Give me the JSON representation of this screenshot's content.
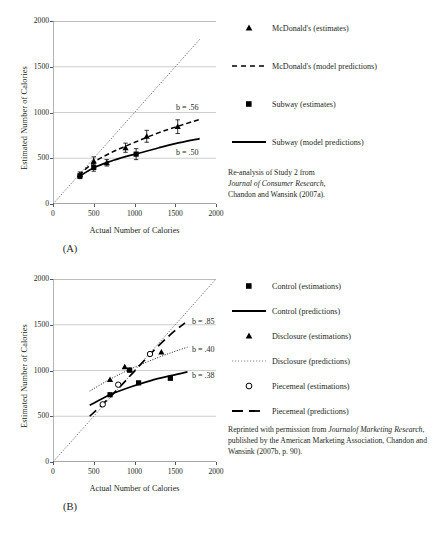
{
  "figure": {
    "panels": [
      {
        "id": "A",
        "panel_label": "(A)",
        "credit_lines": [
          {
            "text": "Re-analysis of Study 2 from",
            "italic": false
          },
          {
            "text": "Journal of Consumer Research,",
            "italic": true
          },
          {
            "text": "Chandon and Wansink (2007a).",
            "italic": false
          }
        ],
        "legend": [
          {
            "label": "McDonald's (estimates)",
            "key": "triangle-marker"
          },
          {
            "label": "McDonald's (model predictions)",
            "key": "dashed-line"
          },
          {
            "label": "Subway (estimates)",
            "key": "square-marker"
          },
          {
            "label": "Subway (model predictions)",
            "key": "solid-line"
          }
        ],
        "slope_labels": [
          {
            "text": "b = .56",
            "series": "McDonald's"
          },
          {
            "text": "b = .50",
            "series": "Subway"
          }
        ]
      },
      {
        "id": "B",
        "panel_label": "(B)",
        "credit_lines": [
          {
            "text": "Reprinted with permission from ",
            "italic": false
          },
          {
            "text": "Journal",
            "italic": true
          },
          {
            "text": "of Marketing Research",
            "italic": true
          },
          {
            "text": ", published by the",
            "italic": false
          },
          {
            "text": "American Marketing Association,",
            "italic": false
          },
          {
            "text": "Chandon and Wansink (2007b, p. 90).",
            "italic": false
          }
        ],
        "legend": [
          {
            "label": "Control (estimations)",
            "key": "square-marker"
          },
          {
            "label": "Control (predictions)",
            "key": "solid-line"
          },
          {
            "label": "Disclosure (estimations)",
            "key": "triangle-marker"
          },
          {
            "label": "Disclosure (predictions)",
            "key": "dotted-line"
          },
          {
            "label": "Piecemeal (estimations)",
            "key": "open-circle-marker"
          },
          {
            "label": "Piecemeal (predictions)",
            "key": "long-dashed-line"
          }
        ],
        "slope_labels": [
          {
            "text": "b = .85",
            "series": "Piecemeal"
          },
          {
            "text": "b = .40",
            "series": "Disclosure"
          },
          {
            "text": "b = .38",
            "series": "Control"
          }
        ]
      }
    ]
  },
  "chart_data": [
    {
      "type": "scatter",
      "panel": "A",
      "title": "",
      "xlabel": "Actual Number of Calories",
      "ylabel": "Estimated Number of Calories",
      "xlim": [
        0,
        2000
      ],
      "ylim": [
        0,
        2000
      ],
      "xticks": [
        0,
        500,
        1000,
        1500,
        2000
      ],
      "yticks": [
        0,
        500,
        1000,
        1500,
        2000
      ],
      "grid": true,
      "legend_position": "right",
      "reference_line": {
        "name": "identity",
        "style": "dotted",
        "from": [
          0,
          0
        ],
        "to": [
          1800,
          1800
        ]
      },
      "series": [
        {
          "name": "McDonald's (estimates)",
          "marker": "triangle",
          "points": [
            {
              "x": 330,
              "y": 320,
              "err": 30
            },
            {
              "x": 500,
              "y": 470,
              "err": 45
            },
            {
              "x": 660,
              "y": 450,
              "err": 35
            },
            {
              "x": 890,
              "y": 615,
              "err": 50
            },
            {
              "x": 1150,
              "y": 740,
              "err": 65
            },
            {
              "x": 1530,
              "y": 845,
              "err": 75
            }
          ]
        },
        {
          "name": "Subway (estimates)",
          "marker": "square",
          "points": [
            {
              "x": 330,
              "y": 305,
              "err": 28
            },
            {
              "x": 500,
              "y": 400,
              "err": 42
            },
            {
              "x": 1020,
              "y": 545,
              "err": 60
            }
          ]
        },
        {
          "name": "McDonald's (model predictions)",
          "marker": "none",
          "line": "dashed",
          "slope_label": "b = .56",
          "curve": [
            {
              "x": 320,
              "y": 315
            },
            {
              "x": 500,
              "y": 455
            },
            {
              "x": 700,
              "y": 555
            },
            {
              "x": 900,
              "y": 635
            },
            {
              "x": 1100,
              "y": 710
            },
            {
              "x": 1300,
              "y": 780
            },
            {
              "x": 1500,
              "y": 840
            },
            {
              "x": 1800,
              "y": 925
            }
          ]
        },
        {
          "name": "Subway (model predictions)",
          "marker": "none",
          "line": "solid",
          "slope_label": "b = .50",
          "curve": [
            {
              "x": 320,
              "y": 300
            },
            {
              "x": 500,
              "y": 395
            },
            {
              "x": 700,
              "y": 465
            },
            {
              "x": 900,
              "y": 520
            },
            {
              "x": 1100,
              "y": 565
            },
            {
              "x": 1300,
              "y": 615
            },
            {
              "x": 1500,
              "y": 660
            },
            {
              "x": 1800,
              "y": 715
            }
          ]
        }
      ]
    },
    {
      "type": "scatter",
      "panel": "B",
      "title": "",
      "xlabel": "Actual Number of Calories",
      "ylabel": "Estimated Number of Calories",
      "xlim": [
        0,
        2000
      ],
      "ylim": [
        0,
        2000
      ],
      "xticks": [
        0,
        500,
        1000,
        1500,
        2000
      ],
      "yticks": [
        0,
        500,
        1000,
        1500,
        2000
      ],
      "grid": true,
      "legend_position": "right",
      "reference_line": {
        "name": "identity",
        "style": "dotted",
        "from": [
          0,
          0
        ],
        "to": [
          1990,
          1990
        ]
      },
      "series": [
        {
          "name": "Control (estimations)",
          "marker": "square",
          "points": [
            {
              "x": 700,
              "y": 735
            },
            {
              "x": 940,
              "y": 1005
            },
            {
              "x": 1050,
              "y": 865
            },
            {
              "x": 1440,
              "y": 915
            }
          ]
        },
        {
          "name": "Disclosure (estimations)",
          "marker": "triangle",
          "points": [
            {
              "x": 700,
              "y": 900
            },
            {
              "x": 880,
              "y": 1040
            },
            {
              "x": 945,
              "y": 1005
            },
            {
              "x": 1330,
              "y": 1200
            }
          ]
        },
        {
          "name": "Piecemeal (estimations)",
          "marker": "open-circle",
          "points": [
            {
              "x": 610,
              "y": 630
            },
            {
              "x": 800,
              "y": 845
            },
            {
              "x": 1190,
              "y": 1180
            }
          ]
        },
        {
          "name": "Control (predictions)",
          "marker": "none",
          "line": "solid",
          "slope_label": "b = .38",
          "curve": [
            {
              "x": 450,
              "y": 620
            },
            {
              "x": 700,
              "y": 735
            },
            {
              "x": 950,
              "y": 820
            },
            {
              "x": 1200,
              "y": 890
            },
            {
              "x": 1450,
              "y": 945
            },
            {
              "x": 1650,
              "y": 985
            }
          ]
        },
        {
          "name": "Disclosure (predictions)",
          "marker": "none",
          "line": "dotted",
          "slope_label": "b = .40",
          "curve": [
            {
              "x": 450,
              "y": 775
            },
            {
              "x": 700,
              "y": 905
            },
            {
              "x": 950,
              "y": 1015
            },
            {
              "x": 1200,
              "y": 1110
            },
            {
              "x": 1450,
              "y": 1195
            },
            {
              "x": 1650,
              "y": 1255
            }
          ]
        },
        {
          "name": "Piecemeal (predictions)",
          "marker": "none",
          "line": "long-dashed",
          "slope_label": "b = .85",
          "curve": [
            {
              "x": 450,
              "y": 500
            },
            {
              "x": 700,
              "y": 710
            },
            {
              "x": 950,
              "y": 945
            },
            {
              "x": 1200,
              "y": 1185
            },
            {
              "x": 1450,
              "y": 1400
            },
            {
              "x": 1620,
              "y": 1520
            }
          ]
        }
      ]
    }
  ]
}
